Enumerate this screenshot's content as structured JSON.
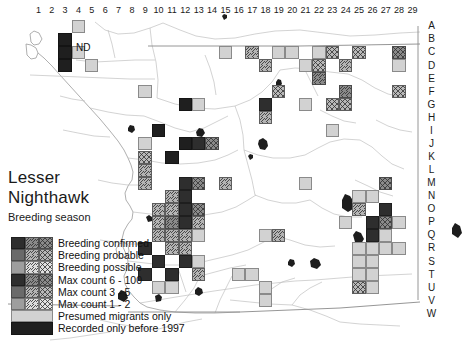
{
  "map": {
    "title_line1": "Lesser",
    "title_line2": "Nighthawk",
    "subtitle": "Breeding season",
    "annotation_nd": "ND",
    "region_name": "San Diego County",
    "column_labels": [
      "1",
      "2",
      "3",
      "4",
      "5",
      "6",
      "7",
      "8",
      "9",
      "10",
      "11",
      "12",
      "13",
      "14",
      "15",
      "16",
      "17",
      "18",
      "19",
      "20",
      "21",
      "22",
      "23",
      "24",
      "25",
      "26",
      "27",
      "28",
      "29"
    ],
    "row_labels": [
      "A",
      "B",
      "C",
      "D",
      "E",
      "F",
      "G",
      "H",
      "I",
      "J",
      "K",
      "L",
      "M",
      "N",
      "O",
      "P",
      "Q",
      "R",
      "S",
      "T",
      "U",
      "V",
      "W"
    ],
    "colors": {
      "background": "#ffffff",
      "coastline": "#8c8c8c",
      "roads": "#b4b4b4",
      "water": "#1a1a1a",
      "grid_border": "#6e6e6e",
      "text": "#1a1a1a"
    }
  },
  "legend": {
    "matrix_header": [
      "Breeding confirmed",
      "Breeding probable",
      "Breeding possible"
    ],
    "count_header": [
      "Max count 6 - 100",
      "Max count 3 - 5",
      "Max count 1 - 2"
    ],
    "rows": [
      {
        "label": "Breeding confirmed",
        "swatches": [
          "c_hi",
          "p_hi",
          "s_hi"
        ]
      },
      {
        "label": "Breeding probable",
        "swatches": [
          "c_md",
          "p_md",
          "s_md"
        ]
      },
      {
        "label": "Breeding possible",
        "swatches": [
          "c_lo",
          "p_lo",
          "s_lo"
        ]
      },
      {
        "label": "Max count 6 - 100",
        "swatches": [
          "c_hi",
          "p_hi",
          "s_hi"
        ]
      },
      {
        "label": "Max count 3 - 5",
        "swatches": [
          "c_md",
          "p_md",
          "s_md"
        ]
      },
      {
        "label": "Max count 1 - 2",
        "swatches": [
          "c_lo",
          "p_lo",
          "s_lo"
        ]
      },
      {
        "label": "Presumed migrants only",
        "swatches": [
          "migrant"
        ],
        "wide": true
      },
      {
        "label": "Recorded only before 1997",
        "swatches": [
          "pre1997"
        ],
        "wide": true
      }
    ]
  },
  "chart_data": {
    "type": "heatmap",
    "xlabel": "",
    "ylabel": "",
    "x": [
      "1",
      "2",
      "3",
      "4",
      "5",
      "6",
      "7",
      "8",
      "9",
      "10",
      "11",
      "12",
      "13",
      "14",
      "15",
      "16",
      "17",
      "18",
      "19",
      "20",
      "21",
      "22",
      "23",
      "24",
      "25",
      "26",
      "27",
      "28",
      "29"
    ],
    "y": [
      "A",
      "B",
      "C",
      "D",
      "E",
      "F",
      "G",
      "H",
      "I",
      "J",
      "K",
      "L",
      "M",
      "N",
      "O",
      "P",
      "Q",
      "R",
      "S",
      "T",
      "U",
      "V",
      "W"
    ],
    "categories_legend": [
      "Breeding confirmed",
      "Breeding probable",
      "Breeding possible",
      "Max count 6 - 100",
      "Max count 3 - 5",
      "Max count 1 - 2",
      "Presumed migrants only",
      "Recorded only before 1997"
    ],
    "grid": true,
    "legend_position": "bottom-left",
    "cells": [
      {
        "c": 4,
        "r": "A",
        "s": "migrant"
      },
      {
        "c": 3,
        "r": "B",
        "s": "pre1997"
      },
      {
        "c": 3,
        "r": "C",
        "s": "pre1997"
      },
      {
        "c": 4,
        "r": "C",
        "s": "migrant"
      },
      {
        "c": 3,
        "r": "D",
        "s": "pre1997"
      },
      {
        "c": 5,
        "r": "D",
        "s": "migrant"
      },
      {
        "c": 15,
        "r": "C",
        "s": "migrant"
      },
      {
        "c": 17,
        "r": "C",
        "s": "p_md"
      },
      {
        "c": 19,
        "r": "C",
        "s": "migrant"
      },
      {
        "c": 20,
        "r": "C",
        "s": "migrant"
      },
      {
        "c": 22,
        "r": "C",
        "s": "migrant"
      },
      {
        "c": 23,
        "r": "C",
        "s": "s_md"
      },
      {
        "c": 25,
        "r": "C",
        "s": "s_md"
      },
      {
        "c": 28,
        "r": "C",
        "s": "s_hi"
      },
      {
        "c": 18,
        "r": "D",
        "s": "p_md"
      },
      {
        "c": 21,
        "r": "D",
        "s": "migrant"
      },
      {
        "c": 22,
        "r": "D",
        "s": "s_md"
      },
      {
        "c": 24,
        "r": "D",
        "s": "p_md"
      },
      {
        "c": 28,
        "r": "D",
        "s": "migrant"
      },
      {
        "c": 22,
        "r": "E",
        "s": "p_hi"
      },
      {
        "c": 9,
        "r": "F",
        "s": "migrant"
      },
      {
        "c": 19,
        "r": "F",
        "s": "s_md"
      },
      {
        "c": 24,
        "r": "F",
        "s": "p_hi"
      },
      {
        "c": 28,
        "r": "F",
        "s": "s_md"
      },
      {
        "c": 18,
        "r": "G",
        "s": "c_hi"
      },
      {
        "c": 21,
        "r": "G",
        "s": "migrant"
      },
      {
        "c": 23,
        "r": "G",
        "s": "s_md"
      },
      {
        "c": 24,
        "r": "G",
        "s": "s_md"
      },
      {
        "c": 12,
        "r": "G",
        "s": "pre1997"
      },
      {
        "c": 13,
        "r": "G",
        "s": "migrant"
      },
      {
        "c": 18,
        "r": "H",
        "s": "p_md"
      },
      {
        "c": 23,
        "r": "I",
        "s": "migrant"
      },
      {
        "c": 9,
        "r": "J",
        "s": "migrant"
      },
      {
        "c": 10,
        "r": "I",
        "s": "pre1997"
      },
      {
        "c": 9,
        "r": "K",
        "s": "s_md"
      },
      {
        "c": 12,
        "r": "J",
        "s": "pre1997"
      },
      {
        "c": 13,
        "r": "J",
        "s": "c_hi"
      },
      {
        "c": 14,
        "r": "J",
        "s": "s_hi"
      },
      {
        "c": 9,
        "r": "L",
        "s": "p_md"
      },
      {
        "c": 11,
        "r": "K",
        "s": "pre1997"
      },
      {
        "c": 9,
        "r": "M",
        "s": "p_md"
      },
      {
        "c": 12,
        "r": "M",
        "s": "c_hi"
      },
      {
        "c": 13,
        "r": "M",
        "s": "s_hi"
      },
      {
        "c": 15,
        "r": "M",
        "s": "p_md"
      },
      {
        "c": 21,
        "r": "M",
        "s": "migrant"
      },
      {
        "c": 27,
        "r": "M",
        "s": "s_hi"
      },
      {
        "c": 11,
        "r": "N",
        "s": "p_md"
      },
      {
        "c": 12,
        "r": "N",
        "s": "c_hi"
      },
      {
        "c": 25,
        "r": "N",
        "s": "migrant"
      },
      {
        "c": 26,
        "r": "N",
        "s": "migrant"
      },
      {
        "c": 11,
        "r": "O",
        "s": "p_md"
      },
      {
        "c": 12,
        "r": "O",
        "s": "c_hi"
      },
      {
        "c": 13,
        "r": "O",
        "s": "s_hi"
      },
      {
        "c": 10,
        "r": "O",
        "s": "p_md"
      },
      {
        "c": 25,
        "r": "O",
        "s": "p_md"
      },
      {
        "c": 27,
        "r": "O",
        "s": "c_hi"
      },
      {
        "c": 11,
        "r": "P",
        "s": "p_hi"
      },
      {
        "c": 12,
        "r": "P",
        "s": "c_hi"
      },
      {
        "c": 13,
        "r": "P",
        "s": "p_md"
      },
      {
        "c": 24,
        "r": "P",
        "s": "migrant"
      },
      {
        "c": 26,
        "r": "P",
        "s": "c_hi"
      },
      {
        "c": 27,
        "r": "P",
        "s": "s_hi"
      },
      {
        "c": 10,
        "r": "P",
        "s": "p_md"
      },
      {
        "c": 28,
        "r": "P",
        "s": "migrant"
      },
      {
        "c": 10,
        "r": "Q",
        "s": "p_md"
      },
      {
        "c": 11,
        "r": "Q",
        "s": "p_md"
      },
      {
        "c": 12,
        "r": "Q",
        "s": "p_md"
      },
      {
        "c": 13,
        "r": "Q",
        "s": "migrant"
      },
      {
        "c": 18,
        "r": "Q",
        "s": "migrant"
      },
      {
        "c": 26,
        "r": "Q",
        "s": "c_hi"
      },
      {
        "c": 27,
        "r": "Q",
        "s": "migrant"
      },
      {
        "c": 19,
        "r": "Q",
        "s": "p_md"
      },
      {
        "c": 9,
        "r": "R",
        "s": "c_hi"
      },
      {
        "c": 11,
        "r": "R",
        "s": "p_md"
      },
      {
        "c": 12,
        "r": "R",
        "s": "p_md"
      },
      {
        "c": 25,
        "r": "R",
        "s": "migrant"
      },
      {
        "c": 26,
        "r": "R",
        "s": "migrant"
      },
      {
        "c": 27,
        "r": "R",
        "s": "migrant"
      },
      {
        "c": 28,
        "r": "R",
        "s": "migrant"
      },
      {
        "c": 10,
        "r": "S",
        "s": "c_hi"
      },
      {
        "c": 12,
        "r": "S",
        "s": "c_hi"
      },
      {
        "c": 13,
        "r": "S",
        "s": "migrant"
      },
      {
        "c": 25,
        "r": "S",
        "s": "migrant"
      },
      {
        "c": 26,
        "r": "S",
        "s": "migrant"
      },
      {
        "c": 9,
        "r": "T",
        "s": "c_hi"
      },
      {
        "c": 11,
        "r": "T",
        "s": "c_hi"
      },
      {
        "c": 13,
        "r": "T",
        "s": "p_md"
      },
      {
        "c": 16,
        "r": "T",
        "s": "migrant"
      },
      {
        "c": 17,
        "r": "T",
        "s": "migrant"
      },
      {
        "c": 25,
        "r": "T",
        "s": "migrant"
      },
      {
        "c": 26,
        "r": "T",
        "s": "migrant"
      },
      {
        "c": 10,
        "r": "U",
        "s": "migrant"
      },
      {
        "c": 11,
        "r": "U",
        "s": "migrant"
      },
      {
        "c": 18,
        "r": "U",
        "s": "migrant"
      },
      {
        "c": 25,
        "r": "U",
        "s": "s_md"
      },
      {
        "c": 26,
        "r": "U",
        "s": "migrant"
      },
      {
        "c": 18,
        "r": "V",
        "s": "migrant"
      }
    ]
  }
}
